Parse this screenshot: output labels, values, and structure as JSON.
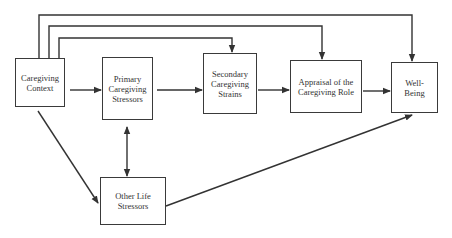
{
  "diagram": {
    "type": "stress-process-model",
    "nodes": [
      {
        "id": "context",
        "label": "Caregiving\nContext"
      },
      {
        "id": "primary",
        "label": "Primary\nCaregiving\nStressors"
      },
      {
        "id": "secondary",
        "label": "Secondary\nCaregiving\nStrains"
      },
      {
        "id": "appraisal",
        "label": "Appraisal of the\nCaregiving Role"
      },
      {
        "id": "wellbeing",
        "label": "Well-\nBeing"
      },
      {
        "id": "other",
        "label": "Other Life\nStressors"
      }
    ],
    "edges": [
      {
        "from": "context",
        "to": "primary",
        "type": "directed"
      },
      {
        "from": "primary",
        "to": "secondary",
        "type": "directed"
      },
      {
        "from": "secondary",
        "to": "appraisal",
        "type": "directed"
      },
      {
        "from": "appraisal",
        "to": "wellbeing",
        "type": "directed"
      },
      {
        "from": "context",
        "to": "secondary",
        "type": "directed",
        "route": "top"
      },
      {
        "from": "context",
        "to": "appraisal",
        "type": "directed",
        "route": "top"
      },
      {
        "from": "context",
        "to": "wellbeing",
        "type": "directed",
        "route": "top"
      },
      {
        "from": "context",
        "to": "other",
        "type": "directed"
      },
      {
        "from": "primary",
        "to": "other",
        "type": "bidirectional"
      },
      {
        "from": "other",
        "to": "wellbeing",
        "type": "directed"
      }
    ],
    "colors": {
      "line": "#333333",
      "box_border": "#3a3a3a",
      "text": "#333333"
    }
  }
}
